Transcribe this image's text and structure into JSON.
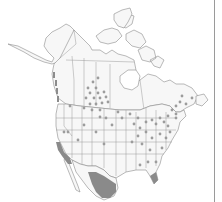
{
  "map": {
    "type": "distribution-map",
    "region": "North America",
    "colors": {
      "background": "#ffffff",
      "land": "#f7f7f7",
      "border": "#8c8c8c",
      "range_fill": "#8a8a8a",
      "point": "#9c9c9c",
      "frame_edge": "#9a9a9a"
    },
    "occurrence_points": [
      [
        93,
        82
      ],
      [
        88,
        88
      ],
      [
        96,
        88
      ],
      [
        90,
        93
      ],
      [
        98,
        93
      ],
      [
        86,
        98
      ],
      [
        94,
        98
      ],
      [
        100,
        98
      ],
      [
        104,
        92
      ],
      [
        106,
        97
      ],
      [
        102,
        103
      ],
      [
        108,
        102
      ],
      [
        96,
        104
      ],
      [
        90,
        104
      ],
      [
        84,
        108
      ],
      [
        92,
        110
      ],
      [
        100,
        110
      ],
      [
        70,
        106
      ],
      [
        98,
        78
      ],
      [
        64,
        132
      ],
      [
        68,
        132
      ],
      [
        84,
        125
      ],
      [
        96,
        132
      ],
      [
        112,
        125
      ],
      [
        106,
        118
      ],
      [
        100,
        117
      ],
      [
        78,
        140
      ],
      [
        104,
        144
      ],
      [
        118,
        112
      ],
      [
        122,
        118
      ],
      [
        130,
        114
      ],
      [
        138,
        118
      ],
      [
        134,
        124
      ],
      [
        140,
        128
      ],
      [
        146,
        122
      ],
      [
        152,
        120
      ],
      [
        156,
        124
      ],
      [
        160,
        118
      ],
      [
        164,
        122
      ],
      [
        168,
        116
      ],
      [
        172,
        110
      ],
      [
        176,
        106
      ],
      [
        180,
        102
      ],
      [
        176,
        114
      ],
      [
        168,
        126
      ],
      [
        170,
        132
      ],
      [
        166,
        138
      ],
      [
        160,
        134
      ],
      [
        152,
        138
      ],
      [
        146,
        132
      ],
      [
        138,
        136
      ],
      [
        142,
        144
      ],
      [
        132,
        142
      ],
      [
        150,
        150
      ],
      [
        162,
        148
      ],
      [
        140,
        165
      ],
      [
        148,
        162
      ],
      [
        156,
        162
      ],
      [
        186,
        104
      ],
      [
        192,
        98
      ],
      [
        182,
        96
      ],
      [
        176,
        118
      ]
    ]
  }
}
